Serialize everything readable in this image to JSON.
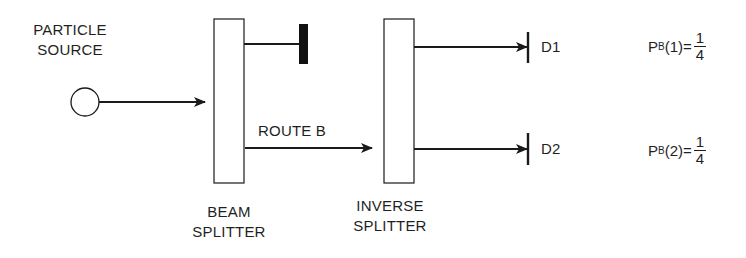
{
  "diagram": {
    "source": {
      "label_line1": "PARTICLE",
      "label_line2": "SOURCE"
    },
    "beam_splitter": {
      "label_line1": "BEAM",
      "label_line2": "SPLITTER"
    },
    "inverse_splitter": {
      "label_line1": "INVERSE",
      "label_line2": "SPLITTER"
    },
    "route_label": "ROUTE B",
    "detectors": [
      {
        "label": "D1",
        "prob_prefix": "P",
        "prob_sub": "B",
        "prob_arg": "(1)=",
        "numerator": "1",
        "denominator": "4"
      },
      {
        "label": "D2",
        "prob_prefix": "P",
        "prob_sub": "B",
        "prob_arg": "(2)=",
        "numerator": "1",
        "denominator": "4"
      }
    ],
    "colors": {
      "stroke": "#1a1a1a",
      "background": "#ffffff"
    }
  }
}
